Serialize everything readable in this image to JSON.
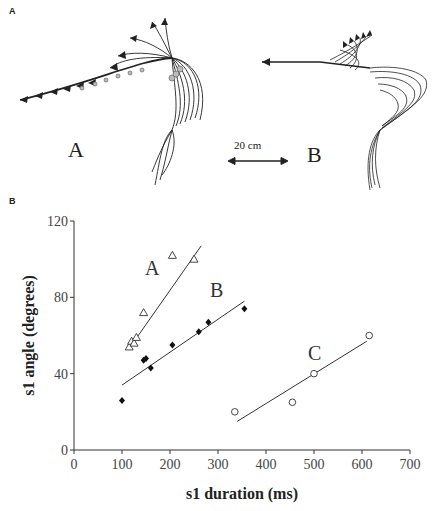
{
  "panel_a": {
    "label": "A",
    "trajectory_a_label": "A",
    "trajectory_b_label": "B",
    "scale_bar_label": "20 cm"
  },
  "panel_b": {
    "label": "B"
  },
  "chart_data": {
    "type": "scatter",
    "title": "",
    "xlabel": "s1 duration (ms)",
    "ylabel": "s1 angle (degrees)",
    "xlim": [
      0,
      700
    ],
    "ylim": [
      0,
      120
    ],
    "xticks": [
      0,
      100,
      200,
      300,
      400,
      500,
      600,
      700
    ],
    "yticks": [
      0,
      40,
      80,
      120
    ],
    "grid": false,
    "legend": "inline labels",
    "series": [
      {
        "name": "A",
        "marker": "open-triangle",
        "points": [
          [
            115,
            54
          ],
          [
            120,
            57
          ],
          [
            125,
            56
          ],
          [
            130,
            59
          ],
          [
            145,
            72
          ],
          [
            205,
            102
          ],
          [
            250,
            100
          ]
        ],
        "fit_line": [
          [
            120,
            55
          ],
          [
            265,
            107
          ]
        ]
      },
      {
        "name": "B",
        "marker": "filled-diamond",
        "points": [
          [
            100,
            26
          ],
          [
            145,
            47
          ],
          [
            150,
            48
          ],
          [
            160,
            43
          ],
          [
            205,
            55
          ],
          [
            260,
            62
          ],
          [
            280,
            67
          ],
          [
            355,
            74
          ]
        ],
        "fit_line": [
          [
            100,
            34
          ],
          [
            355,
            78
          ]
        ]
      },
      {
        "name": "C",
        "marker": "open-circle",
        "points": [
          [
            335,
            20
          ],
          [
            455,
            25
          ],
          [
            500,
            40
          ],
          [
            615,
            60
          ]
        ],
        "fit_line": [
          [
            340,
            15
          ],
          [
            610,
            57
          ]
        ]
      }
    ]
  }
}
